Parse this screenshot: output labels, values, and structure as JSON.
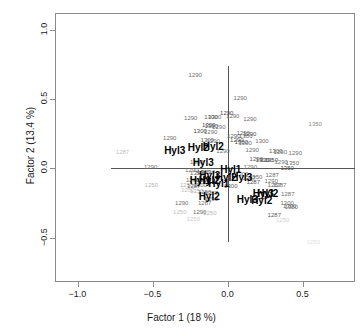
{
  "chart_data": {
    "type": "scatter",
    "title": "",
    "xlabel": "Factor 1  (18 %)",
    "ylabel": "Factor 2  (13.4 %)",
    "xlim": [
      -1.15,
      0.85
    ],
    "ylim": [
      -0.82,
      1.12
    ],
    "xticks": [
      -1.0,
      -0.5,
      0.0,
      0.5
    ],
    "xticklabels": [
      "-1.0",
      "-0.5",
      "0.0",
      "0.5"
    ],
    "yticks": [
      1.0,
      0.5,
      0.0,
      -0.5
    ],
    "yticklabels": [
      "1.0",
      "0.5",
      "0.0",
      "-0.5"
    ],
    "grid": false,
    "legend": null,
    "reference_lines": {
      "vertical_x": 0.0,
      "horizontal_y": 0.0,
      "color": "#555555"
    },
    "series": [
      {
        "name": "scores",
        "kind": "text-labels",
        "style": "gray-small",
        "points": [
          {
            "label": "1290",
            "x": -0.215,
            "y": 0.675,
            "shade": "#6e6e6e"
          },
          {
            "label": "1290",
            "x": 0.085,
            "y": 0.508,
            "shade": "#6e6e6e"
          },
          {
            "label": "1290",
            "x": -0.005,
            "y": 0.398,
            "shade": "#4a4a4a"
          },
          {
            "label": "1290",
            "x": 0.035,
            "y": 0.378,
            "shade": "#6e6e6e"
          },
          {
            "label": "1300",
            "x": -0.11,
            "y": 0.372,
            "shade": "#5a5a5a"
          },
          {
            "label": "1300",
            "x": -0.085,
            "y": 0.368,
            "shade": "#6e6e6e"
          },
          {
            "label": "1290",
            "x": -0.245,
            "y": 0.362,
            "shade": "#6e6e6e"
          },
          {
            "label": "1290",
            "x": 0.15,
            "y": 0.352,
            "shade": "#6e6e6e"
          },
          {
            "label": "1350",
            "x": 0.585,
            "y": 0.322,
            "shade": "#8a8a8a"
          },
          {
            "label": "1300",
            "x": -0.125,
            "y": 0.312,
            "shade": "#4a4a4a"
          },
          {
            "label": "1300",
            "x": -0.108,
            "y": 0.308,
            "shade": "#5a5a5a"
          },
          {
            "label": "1290",
            "x": -0.058,
            "y": 0.298,
            "shade": "#6e6e6e"
          },
          {
            "label": "1300",
            "x": -0.182,
            "y": 0.268,
            "shade": "#4a4a4a"
          },
          {
            "label": "1290",
            "x": -0.112,
            "y": 0.262,
            "shade": "#6e6e6e"
          },
          {
            "label": "1290",
            "x": 0.105,
            "y": 0.258,
            "shade": "#6e6e6e"
          },
          {
            "label": "1290",
            "x": 0.148,
            "y": 0.248,
            "shade": "#4a4a4a"
          },
          {
            "label": "1290",
            "x": 0.042,
            "y": 0.235,
            "shade": "#5a5a5a"
          },
          {
            "label": "1300",
            "x": 0.122,
            "y": 0.232,
            "shade": "#6e6e6e"
          },
          {
            "label": "1290",
            "x": -0.385,
            "y": 0.218,
            "shade": "#6e6e6e"
          },
          {
            "label": "1300",
            "x": -0.135,
            "y": 0.205,
            "shade": "#5a5a5a"
          },
          {
            "label": "1290",
            "x": -0.095,
            "y": 0.198,
            "shade": "#6e6e6e"
          },
          {
            "label": "1290",
            "x": 0.062,
            "y": 0.202,
            "shade": "#5a5a5a"
          },
          {
            "label": "1300",
            "x": 0.092,
            "y": 0.188,
            "shade": "#4a4a4a"
          },
          {
            "label": "1300",
            "x": 0.118,
            "y": 0.186,
            "shade": "#6e6e6e"
          },
          {
            "label": "1300",
            "x": 0.23,
            "y": 0.195,
            "shade": "#6e6e6e"
          },
          {
            "label": "1290",
            "x": 0.165,
            "y": 0.135,
            "shade": "#6e6e6e"
          },
          {
            "label": "1287",
            "x": -0.7,
            "y": 0.118,
            "shade": "#c0c0c0"
          },
          {
            "label": "1290",
            "x": -0.03,
            "y": 0.128,
            "shade": "#6e6e6e"
          },
          {
            "label": "1300",
            "x": 0.322,
            "y": 0.122,
            "shade": "#5a5a5a"
          },
          {
            "label": "1290",
            "x": 0.352,
            "y": 0.12,
            "shade": "#6e6e6e"
          },
          {
            "label": "1290",
            "x": 0.452,
            "y": 0.112,
            "shade": "#6e6e6e"
          },
          {
            "label": "1290",
            "x": 0.192,
            "y": 0.068,
            "shade": "#5a5a5a"
          },
          {
            "label": "1300",
            "x": 0.232,
            "y": 0.062,
            "shade": "#4a4a4a"
          },
          {
            "label": "1290",
            "x": 0.262,
            "y": 0.06,
            "shade": "#6e6e6e"
          },
          {
            "label": "1350",
            "x": 0.292,
            "y": 0.058,
            "shade": "#5a5a5a"
          },
          {
            "label": "1290",
            "x": 0.358,
            "y": 0.045,
            "shade": "#6e6e6e"
          },
          {
            "label": "1350",
            "x": 0.432,
            "y": 0.035,
            "shade": "#6e6e6e"
          },
          {
            "label": "1290",
            "x": -0.205,
            "y": 0.048,
            "shade": "#6e6e6e"
          },
          {
            "label": "1290",
            "x": -0.512,
            "y": 0.012,
            "shade": "#6e6e6e"
          },
          {
            "label": "1290",
            "x": 0.152,
            "y": 0.008,
            "shade": "#6e6e6e"
          },
          {
            "label": "1350",
            "x": 0.398,
            "y": 0.002,
            "shade": "#4a4a4a"
          },
          {
            "label": "1290",
            "x": -0.238,
            "y": -0.015,
            "shade": "#6e6e6e"
          },
          {
            "label": "1350",
            "x": -0.205,
            "y": -0.032,
            "shade": "#5a5a5a"
          },
          {
            "label": "1300",
            "x": -0.158,
            "y": -0.03,
            "shade": "#5a5a5a"
          },
          {
            "label": "1290",
            "x": -0.128,
            "y": -0.028,
            "shade": "#6e6e6e"
          },
          {
            "label": "1300",
            "x": 0.095,
            "y": -0.042,
            "shade": "#6e6e6e"
          },
          {
            "label": "1287",
            "x": 0.298,
            "y": -0.048,
            "shade": "#6e6e6e"
          },
          {
            "label": "1287",
            "x": 0.145,
            "y": -0.072,
            "shade": "#5a5a5a"
          },
          {
            "label": "1350",
            "x": 0.188,
            "y": -0.065,
            "shade": "#6e6e6e"
          },
          {
            "label": "1290",
            "x": -0.232,
            "y": -0.082,
            "shade": "#6e6e6e"
          },
          {
            "label": "1300",
            "x": -0.16,
            "y": -0.085,
            "shade": "#5a5a5a"
          },
          {
            "label": "1287",
            "x": 0.172,
            "y": -0.098,
            "shade": "#4a4a4a"
          },
          {
            "label": "1290",
            "x": 0.292,
            "y": -0.095,
            "shade": "#6e6e6e"
          },
          {
            "label": "1250",
            "x": -0.508,
            "y": -0.122,
            "shade": "#b4b4b4"
          },
          {
            "label": "1250",
            "x": -0.272,
            "y": -0.118,
            "shade": "#b4b4b4"
          },
          {
            "label": "1287",
            "x": -0.225,
            "y": -0.125,
            "shade": "#5a5a5a"
          },
          {
            "label": "1300",
            "x": -0.182,
            "y": -0.122,
            "shade": "#6e6e6e"
          },
          {
            "label": "1300",
            "x": 0.022,
            "y": -0.128,
            "shade": "#5a5a5a"
          },
          {
            "label": "1287",
            "x": 0.312,
            "y": -0.118,
            "shade": "#6e6e6e"
          },
          {
            "label": "1287",
            "x": 0.348,
            "y": -0.122,
            "shade": "#6e6e6e"
          },
          {
            "label": "1250",
            "x": -0.265,
            "y": -0.158,
            "shade": "#c0c0c0"
          },
          {
            "label": "1250",
            "x": -0.205,
            "y": -0.162,
            "shade": "#b4b4b4"
          },
          {
            "label": "1290",
            "x": -0.152,
            "y": -0.172,
            "shade": "#6e6e6e"
          },
          {
            "label": "1287",
            "x": -0.108,
            "y": -0.175,
            "shade": "#5a5a5a"
          },
          {
            "label": "1287",
            "x": 0.402,
            "y": -0.188,
            "shade": "#6e6e6e"
          },
          {
            "label": "1290",
            "x": -0.108,
            "y": -0.218,
            "shade": "#5a5a5a"
          },
          {
            "label": "1290",
            "x": -0.305,
            "y": -0.252,
            "shade": "#6e6e6e"
          },
          {
            "label": "1287",
            "x": -0.152,
            "y": -0.25,
            "shade": "#6e6e6e"
          },
          {
            "label": "1300",
            "x": 0.398,
            "y": -0.252,
            "shade": "#6e6e6e"
          },
          {
            "label": "1300",
            "x": 0.415,
            "y": -0.272,
            "shade": "#5a5a5a"
          },
          {
            "label": "1350",
            "x": 0.425,
            "y": -0.278,
            "shade": "#6e6e6e"
          },
          {
            "label": "1250",
            "x": -0.318,
            "y": -0.318,
            "shade": "#c0c0c0"
          },
          {
            "label": "1290",
            "x": -0.185,
            "y": -0.312,
            "shade": "#6e6e6e"
          },
          {
            "label": "1250",
            "x": -0.118,
            "y": -0.322,
            "shade": "#b4b4b4"
          },
          {
            "label": "1287",
            "x": 0.312,
            "y": -0.335,
            "shade": "#5a5a5a"
          },
          {
            "label": "1250",
            "x": -0.228,
            "y": -0.368,
            "shade": "#cacaca"
          },
          {
            "label": "1250",
            "x": 0.368,
            "y": -0.372,
            "shade": "#d2d2d2"
          },
          {
            "label": "1250",
            "x": 0.572,
            "y": -0.535,
            "shade": "#dcdcdc"
          }
        ]
      },
      {
        "name": "loadings",
        "kind": "text-labels",
        "style": "black-bold",
        "points": [
          {
            "label": "Hyl3",
            "x": -0.352,
            "y": 0.122
          },
          {
            "label": "Hyl2",
            "x": -0.195,
            "y": 0.15
          },
          {
            "label": "Hyl2",
            "x": -0.095,
            "y": 0.152
          },
          {
            "label": "Hyl3",
            "x": -0.162,
            "y": 0.038
          },
          {
            "label": "Hyl1",
            "x": 0.022,
            "y": -0.015
          },
          {
            "label": "Hyl3",
            "x": -0.118,
            "y": -0.055
          },
          {
            "label": "Hyl2",
            "x": -0.008,
            "y": -0.068
          },
          {
            "label": "Hyl3",
            "x": 0.095,
            "y": -0.072
          },
          {
            "label": "Hyl1",
            "x": -0.182,
            "y": -0.095
          },
          {
            "label": "Hyl2",
            "x": -0.122,
            "y": -0.095
          },
          {
            "label": "Hyl1",
            "x": -0.058,
            "y": -0.112
          },
          {
            "label": "Hyl3",
            "x": 0.238,
            "y": -0.185
          },
          {
            "label": "Hyl2",
            "x": 0.268,
            "y": -0.188
          },
          {
            "label": "Hyl2",
            "x": -0.122,
            "y": -0.205
          },
          {
            "label": "Hyl3",
            "x": 0.132,
            "y": -0.232
          },
          {
            "label": "Hyl2",
            "x": 0.228,
            "y": -0.235
          }
        ]
      }
    ]
  }
}
